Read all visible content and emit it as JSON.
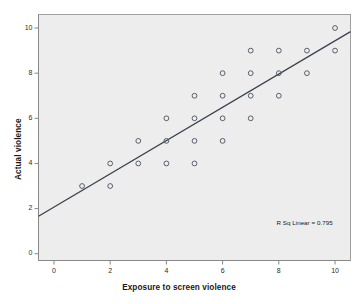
{
  "chart_data": {
    "type": "scatter",
    "title": "",
    "xlabel": "Exposure to screen violence",
    "ylabel": "Actual violence",
    "xlim": [
      -0.55,
      10.55
    ],
    "ylim": [
      -0.3,
      10.6
    ],
    "xticks": [
      0,
      2,
      4,
      6,
      8,
      10
    ],
    "yticks": [
      0,
      2,
      4,
      6,
      8,
      10
    ],
    "xtick_labels": [
      "0",
      "2",
      "4",
      "6",
      "8",
      "10"
    ],
    "ytick_labels": [
      "0",
      "2",
      "4",
      "6",
      "8",
      "10"
    ],
    "grid": false,
    "legend": "none",
    "annotation": "R Sq Linear = 0.795",
    "r_squared": 0.795,
    "points": [
      {
        "x": 1,
        "y": 3
      },
      {
        "x": 2,
        "y": 4
      },
      {
        "x": 2,
        "y": 3
      },
      {
        "x": 3,
        "y": 5
      },
      {
        "x": 3,
        "y": 4
      },
      {
        "x": 4,
        "y": 6
      },
      {
        "x": 4,
        "y": 5
      },
      {
        "x": 4,
        "y": 4
      },
      {
        "x": 5,
        "y": 7
      },
      {
        "x": 5,
        "y": 6
      },
      {
        "x": 5,
        "y": 5
      },
      {
        "x": 5,
        "y": 4
      },
      {
        "x": 6,
        "y": 8
      },
      {
        "x": 6,
        "y": 7
      },
      {
        "x": 6,
        "y": 6
      },
      {
        "x": 6,
        "y": 5
      },
      {
        "x": 7,
        "y": 9
      },
      {
        "x": 7,
        "y": 8
      },
      {
        "x": 7,
        "y": 7
      },
      {
        "x": 7,
        "y": 6
      },
      {
        "x": 8,
        "y": 9
      },
      {
        "x": 8,
        "y": 8
      },
      {
        "x": 8,
        "y": 7
      },
      {
        "x": 9,
        "y": 9
      },
      {
        "x": 9,
        "y": 8
      },
      {
        "x": 10,
        "y": 10
      },
      {
        "x": 10,
        "y": 9
      }
    ],
    "fit_line": {
      "type": "linear",
      "slope": 0.736,
      "intercept": 2.07,
      "x_start": -0.55,
      "x_end": 10.55,
      "y_start": 1.66,
      "y_end": 9.84
    },
    "colors": {
      "plot_background": "#ededed",
      "plot_border": "#a0a0a0",
      "marker_stroke": "#555f6d",
      "fit_line": "#3c4250",
      "axis": "#888888",
      "text": "#1a1a1a"
    }
  }
}
